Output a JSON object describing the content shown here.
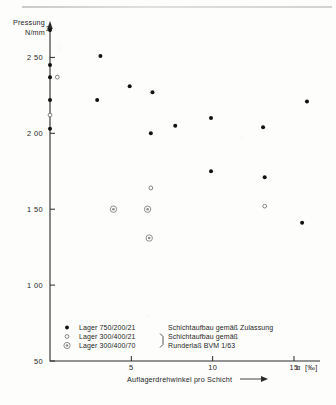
{
  "figure": {
    "kind": "scatter-plot-scan",
    "background_color": "#fdfdfc",
    "ink_color": "#111111"
  },
  "chart_data": {
    "type": "scatter",
    "title": "",
    "ylabel_line1": "Pressung",
    "ylabel_line2": "N/mm",
    "ylabel_exponent": "2",
    "xlabel": "Auflagerdrehwinkel pro Schicht",
    "xunit_symbol": "α",
    "xunit_bracket": "[‰]",
    "xlim": [
      0,
      16.6
    ],
    "ylim": [
      0.5,
      2.72
    ],
    "grid": false,
    "legend_position": "inside-bottom-left",
    "xticks": [
      5,
      10,
      15
    ],
    "xtick_labels": [
      "5",
      "10",
      "15"
    ],
    "yticks": [
      0.5,
      1.0,
      1.5,
      2.0,
      2.5
    ],
    "ytick_labels": [
      "50",
      "1 00",
      "1 50",
      "2 00",
      "2 50"
    ],
    "series": [
      {
        "name": "Lager 750/200/21",
        "marker": "filled-dot",
        "points": [
          [
            0.0,
            2.68
          ],
          [
            0.0,
            2.45
          ],
          [
            0.0,
            2.37
          ],
          [
            0.0,
            2.22
          ],
          [
            0.0,
            2.03
          ],
          [
            3.1,
            2.51
          ],
          [
            2.9,
            2.22
          ],
          [
            4.9,
            2.31
          ],
          [
            6.3,
            2.27
          ],
          [
            6.2,
            2.0
          ],
          [
            7.7,
            2.05
          ],
          [
            9.9,
            2.1
          ],
          [
            13.1,
            2.04
          ],
          [
            9.9,
            1.75
          ],
          [
            13.2,
            1.71
          ],
          [
            15.8,
            2.21
          ],
          [
            15.5,
            1.41
          ]
        ]
      },
      {
        "name": "Lager 300/400/21",
        "marker": "open-circle",
        "points": [
          [
            0.45,
            2.37
          ],
          [
            0.0,
            2.12
          ],
          [
            6.2,
            1.64
          ],
          [
            13.2,
            1.52
          ]
        ]
      },
      {
        "name": "Lager 300/400/70",
        "marker": "double-circle",
        "points": [
          [
            3.9,
            1.5
          ],
          [
            6.0,
            1.5
          ],
          [
            6.1,
            1.31
          ]
        ]
      }
    ]
  },
  "legend": {
    "rows": [
      {
        "marker": "filled-dot",
        "label": "Lager   750/200/21",
        "description": "Schichtaufbau gemäß Zulassung"
      },
      {
        "marker": "open-circle",
        "label": "Lager   300/400/21",
        "description": "Schichtaufbau gemäß"
      },
      {
        "marker": "double-circle",
        "label": "Lager   300/400/70",
        "description": "Runderlaß BVM 1/63"
      }
    ]
  }
}
